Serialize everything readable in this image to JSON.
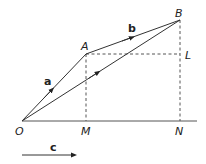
{
  "diagram": {
    "type": "vector-diagram",
    "points": {
      "O": {
        "label": "O",
        "x": 22,
        "y": 121
      },
      "A": {
        "label": "A",
        "x": 86,
        "y": 54
      },
      "B": {
        "label": "B",
        "x": 180,
        "y": 20
      },
      "L": {
        "label": "L",
        "x": 180,
        "y": 54
      },
      "M": {
        "label": "M",
        "x": 86,
        "y": 121
      },
      "N": {
        "label": "N",
        "x": 180,
        "y": 121
      }
    },
    "vectors": {
      "a": {
        "label": "a",
        "from": "O",
        "to": "A"
      },
      "b": {
        "label": "b",
        "from": "A",
        "to": "B"
      },
      "c": {
        "label": "c",
        "note": "reference direction arrow"
      }
    },
    "segments": [
      "O-B (arrow)",
      "O-N baseline",
      "A-M dashed",
      "A-L dashed",
      "B-N dashed"
    ],
    "colors": {
      "line": "#333333",
      "dashed": "#555555",
      "text": "#222222"
    }
  }
}
